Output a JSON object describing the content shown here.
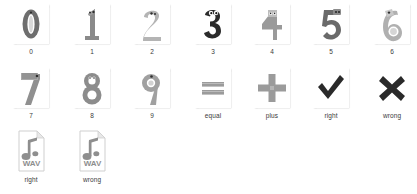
{
  "background_color": "#ffffff",
  "grid": {
    "columns": 7,
    "rows": 3,
    "items": [
      {
        "label": "0",
        "icon": "numeral-0-character-thumbnail",
        "kind": "image",
        "row": 1,
        "col": 0,
        "ink": "#6e6e6e"
      },
      {
        "label": "1",
        "icon": "numeral-1-character-thumbnail",
        "kind": "image",
        "row": 1,
        "col": 1,
        "ink": "#8a8a8a"
      },
      {
        "label": "2",
        "icon": "numeral-2-character-thumbnail",
        "kind": "image",
        "row": 1,
        "col": 2,
        "ink": "#b4b4b4"
      },
      {
        "label": "3",
        "icon": "numeral-3-character-thumbnail",
        "kind": "image",
        "row": 1,
        "col": 3,
        "ink": "#2b2b2b"
      },
      {
        "label": "4",
        "icon": "numeral-4-character-thumbnail",
        "kind": "image",
        "row": 1,
        "col": 4,
        "ink": "#9a9a9a"
      },
      {
        "label": "5",
        "icon": "numeral-5-character-thumbnail",
        "kind": "image",
        "row": 1,
        "col": 5,
        "ink": "#6a6a6a"
      },
      {
        "label": "6",
        "icon": "numeral-6-character-thumbnail",
        "kind": "image",
        "row": 1,
        "col": 6,
        "ink": "#b0b0b0"
      },
      {
        "label": "7",
        "icon": "numeral-7-character-thumbnail",
        "kind": "image",
        "row": 2,
        "col": 0,
        "ink": "#909090"
      },
      {
        "label": "8",
        "icon": "numeral-8-character-thumbnail",
        "kind": "image",
        "row": 2,
        "col": 1,
        "ink": "#8c8c8c"
      },
      {
        "label": "9",
        "icon": "numeral-9-character-thumbnail",
        "kind": "image",
        "row": 2,
        "col": 2,
        "ink": "#a0a0a0"
      },
      {
        "label": "equal",
        "icon": "equals-sign-thumbnail",
        "kind": "image",
        "row": 2,
        "col": 3,
        "ink": "#9b9b9b"
      },
      {
        "label": "plus",
        "icon": "plus-sign-thumbnail",
        "kind": "image",
        "row": 2,
        "col": 4,
        "ink": "#9b9b9b"
      },
      {
        "label": "right",
        "icon": "checkmark-thumbnail",
        "kind": "image",
        "row": 2,
        "col": 5,
        "ink": "#2a2a2a"
      },
      {
        "label": "wrong",
        "icon": "cross-mark-thumbnail",
        "kind": "image",
        "row": 2,
        "col": 6,
        "ink": "#2a2a2a"
      },
      {
        "label": "right",
        "icon": "wav-audio-file-icon",
        "kind": "audio",
        "row": 3,
        "col": 0,
        "ink": "#8e8e8e",
        "file_type": "WAV"
      },
      {
        "label": "wrong",
        "icon": "wav-audio-file-icon",
        "kind": "audio",
        "row": 3,
        "col": 1,
        "ink": "#8e8e8e",
        "file_type": "WAV"
      }
    ]
  }
}
